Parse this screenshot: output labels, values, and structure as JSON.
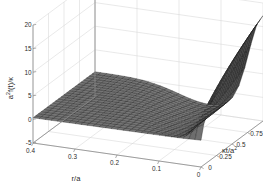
{
  "figure": {
    "background_color": "#ffffff",
    "mesh_color": "#4a4a4a",
    "mesh_line_color": "#151515",
    "grid_color": "#d8d8d8",
    "axis_color": "#8a8a8a",
    "text_color": "#2b2b2b"
  },
  "chart_data": {
    "type": "surface",
    "title": "",
    "xlabel": "r/a",
    "ylabel": "κt/a²",
    "zlabel": "a²f(t)/κ",
    "zlabel_parts": {
      "base1": "a",
      "sup1": "2",
      "mid": "f(t)/",
      "base2": "κ"
    },
    "ylabel_parts": {
      "base": "κt/a",
      "sup": "2"
    },
    "xticks": [
      "0.4",
      "0.3",
      "0.2",
      "0.1",
      "0"
    ],
    "xtick_values": [
      0.4,
      0.3,
      0.2,
      0.1,
      0
    ],
    "yticks": [
      "0",
      "0.25",
      "0.5",
      "0.75",
      "1"
    ],
    "ytick_values": [
      0,
      0.25,
      0.5,
      0.75,
      1
    ],
    "zticks": [
      "-5",
      "0",
      "5",
      "10",
      "15",
      "20"
    ],
    "ztick_values": [
      -5,
      0,
      5,
      10,
      15,
      20
    ],
    "xlim": [
      0,
      0.4
    ],
    "ylim": [
      0,
      1
    ],
    "zlim": [
      -5,
      20
    ],
    "grid": true,
    "legend": "none",
    "mesh_style": "wireframe-shaded",
    "view": {
      "azimuth": -37.5,
      "elevation": 30
    },
    "peak_value": 18,
    "trough_value": -3,
    "plateau_value": 0.5,
    "nx": 28,
    "ny": 22
  }
}
